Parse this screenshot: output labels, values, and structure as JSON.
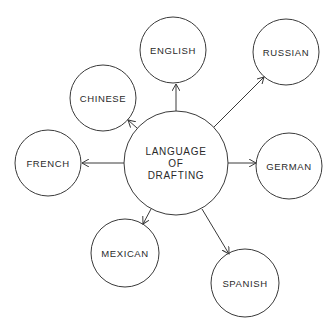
{
  "diagram": {
    "type": "hub-and-spoke",
    "center": {
      "lines": [
        "LANGUAGE",
        "OF",
        "DRAFTING"
      ],
      "cx": 176,
      "cy": 163,
      "r": 52
    },
    "nodes": [
      {
        "label": "ENGLISH",
        "cx": 173,
        "cy": 50,
        "r": 33
      },
      {
        "label": "RUSSIAN",
        "cx": 286,
        "cy": 52,
        "r": 33
      },
      {
        "label": "CHINESE",
        "cx": 103,
        "cy": 98,
        "r": 33
      },
      {
        "label": "FRENCH",
        "cx": 48,
        "cy": 163,
        "r": 33
      },
      {
        "label": "GERMAN",
        "cx": 289,
        "cy": 166,
        "r": 33
      },
      {
        "label": "MEXICAN",
        "cx": 125,
        "cy": 253,
        "r": 34
      },
      {
        "label": "SPANISH",
        "cx": 245,
        "cy": 283,
        "r": 34
      }
    ],
    "edges": [
      {
        "from": "LANGUAGE OF DRAFTING",
        "to": "ENGLISH"
      },
      {
        "from": "LANGUAGE OF DRAFTING",
        "to": "RUSSIAN"
      },
      {
        "from": "LANGUAGE OF DRAFTING",
        "to": "CHINESE"
      },
      {
        "from": "LANGUAGE OF DRAFTING",
        "to": "FRENCH"
      },
      {
        "from": "LANGUAGE OF DRAFTING",
        "to": "GERMAN"
      },
      {
        "from": "LANGUAGE OF DRAFTING",
        "to": "MEXICAN"
      },
      {
        "from": "LANGUAGE OF DRAFTING",
        "to": "SPANISH"
      }
    ],
    "colors": {
      "stroke": "#3a3a3a",
      "text": "#2a2a2a",
      "background": "#ffffff"
    }
  }
}
